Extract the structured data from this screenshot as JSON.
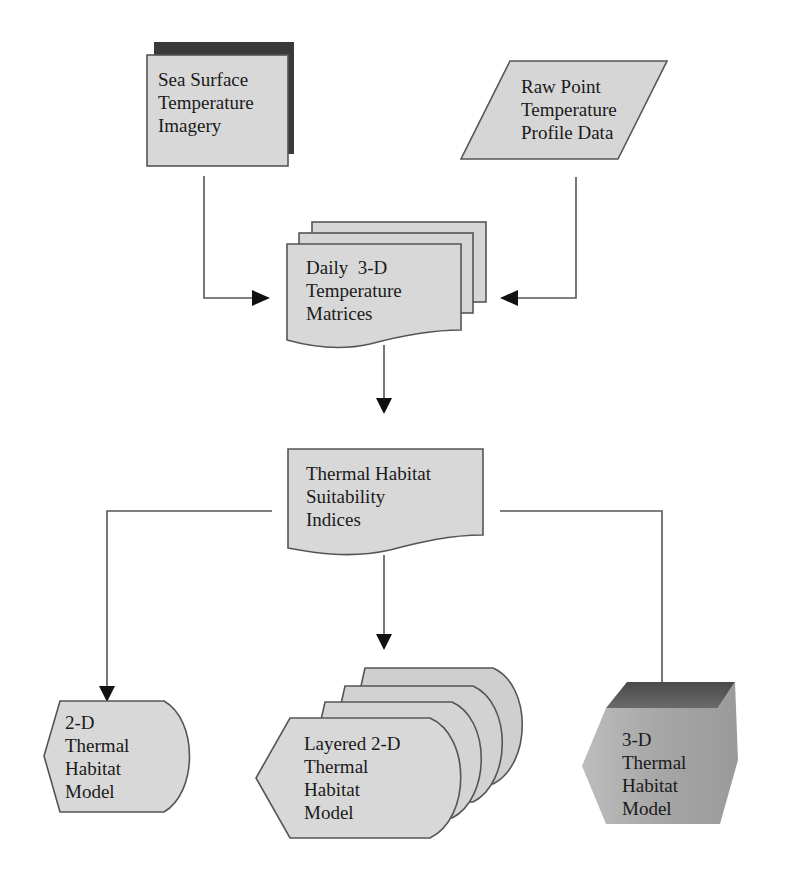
{
  "diagram": {
    "type": "flowchart",
    "nodes": {
      "sst": {
        "shape": "shadowed-rectangle",
        "lines": [
          "Sea Surface",
          "Temperature",
          "Imagery"
        ]
      },
      "raw": {
        "shape": "parallelogram (data)",
        "lines": [
          "Raw Point",
          "Temperature",
          "Profile Data"
        ]
      },
      "daily": {
        "shape": "multi-document",
        "lines": [
          "Daily  3-D",
          "Temperature",
          "Matrices"
        ]
      },
      "thsi": {
        "shape": "document",
        "lines": [
          "Thermal Habitat",
          "Suitability",
          "Indices"
        ]
      },
      "model2d": {
        "shape": "display",
        "lines": [
          "2-D",
          "Thermal",
          "Habitat",
          "Model"
        ]
      },
      "layered": {
        "shape": "stacked-display",
        "lines": [
          "Layered 2-D",
          "Thermal",
          "Habitat",
          "Model"
        ]
      },
      "model3d": {
        "shape": "3d-hexagon",
        "lines": [
          "3-D",
          "Thermal",
          "Habitat",
          "Model"
        ]
      }
    },
    "edges": [
      {
        "from": "Sea Surface Temperature Imagery",
        "to": "Daily 3-D Temperature Matrices"
      },
      {
        "from": "Raw Point Temperature Profile Data",
        "to": "Daily 3-D Temperature Matrices"
      },
      {
        "from": "Daily 3-D Temperature Matrices",
        "to": "Thermal Habitat Suitability Indices"
      },
      {
        "from": "Thermal Habitat Suitability Indices",
        "to": "2-D Thermal Habitat Model"
      },
      {
        "from": "Thermal Habitat Suitability Indices",
        "to": "Layered 2-D Thermal Habitat Model"
      },
      {
        "from": "Thermal Habitat Suitability Indices",
        "to": "3-D Thermal Habitat Model"
      }
    ],
    "colors": {
      "shape_fill": "#d6d6d6",
      "shape_stroke": "#555555",
      "shadow_dark": "#3a3a3a",
      "model3d_fill": "#a9a9a9",
      "model3d_top": "#5a5a5a",
      "arrow": "#111111",
      "line": "#555555"
    }
  }
}
